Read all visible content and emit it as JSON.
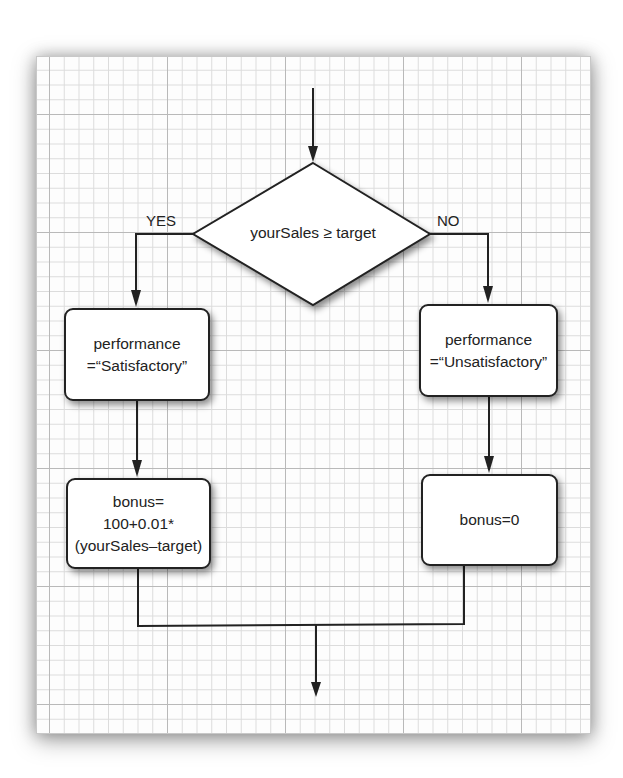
{
  "diagram": {
    "type": "flowchart",
    "decision": {
      "text": "yourSales ≥ target"
    },
    "branches": {
      "yes": {
        "label": "YES",
        "steps": [
          {
            "lines": [
              "performance",
              "=“Satisfactory”"
            ]
          },
          {
            "lines": [
              "bonus=",
              "100+0.01*",
              "(yourSales–target)"
            ]
          }
        ]
      },
      "no": {
        "label": "NO",
        "steps": [
          {
            "lines": [
              "performance",
              "=“Unsatisfactory”"
            ]
          },
          {
            "lines": [
              "bonus=0"
            ]
          }
        ]
      }
    }
  },
  "colors": {
    "line": "#222222",
    "grid_major": "#b9b9b9",
    "grid_minor": "#dcdcdc",
    "paper": "#fdfdfd"
  }
}
